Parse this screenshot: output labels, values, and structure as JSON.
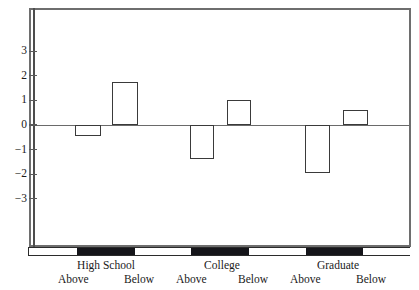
{
  "chart_data": {
    "type": "bar",
    "title": "",
    "subtitle": "",
    "xlabel": "",
    "ylabel": "",
    "ylim": [
      -3.8,
      3.8
    ],
    "grid": false,
    "legend": "none",
    "orientation": "vertical",
    "baseline": 0,
    "y_ticks": [
      3,
      2,
      1,
      0,
      -1,
      -2,
      -3
    ],
    "y_tick_labels": [
      "3",
      "2",
      "1",
      "0",
      "−1",
      "−2",
      "−3"
    ],
    "groups": [
      "High School",
      "College",
      "Graduate"
    ],
    "categories": [
      "High School Above",
      "High School Below",
      "College Above",
      "College Below",
      "Graduate Above",
      "Graduate Below"
    ],
    "subcategory_labels": [
      "Above",
      "Below"
    ],
    "values": [
      -0.45,
      1.75,
      -1.4,
      1.0,
      -1.95,
      0.62
    ],
    "bars": [
      {
        "group": "High School",
        "sub": "Above",
        "value": -0.45
      },
      {
        "group": "High School",
        "sub": "Below",
        "value": 1.75
      },
      {
        "group": "College",
        "sub": "Above",
        "value": -1.4
      },
      {
        "group": "College",
        "sub": "Below",
        "value": 1.0
      },
      {
        "group": "Graduate",
        "sub": "Above",
        "value": -1.95
      },
      {
        "group": "Graduate",
        "sub": "Below",
        "value": 0.62
      }
    ],
    "colors": {
      "bar_fill": "#ffffff",
      "bar_edge": "#3a3a3a",
      "axis": "#6e6e6e",
      "baseline": "#6a6a6a",
      "ruler_black": "#15151a",
      "ruler_white": "#ffffff",
      "text": "#1a1a1a",
      "background": "#ffffff"
    }
  },
  "axis": {
    "ruler_blocks": [
      {
        "fill": "white"
      },
      {
        "fill": "black"
      },
      {
        "fill": "white"
      },
      {
        "fill": "black"
      },
      {
        "fill": "white"
      },
      {
        "fill": "black"
      },
      {
        "fill": "white"
      }
    ]
  },
  "group_labels": [
    {
      "name": "High School",
      "above": "Above",
      "below": "Below"
    },
    {
      "name": "College",
      "above": "Above",
      "below": "Below"
    },
    {
      "name": "Graduate",
      "above": "Above",
      "below": "Below"
    }
  ]
}
